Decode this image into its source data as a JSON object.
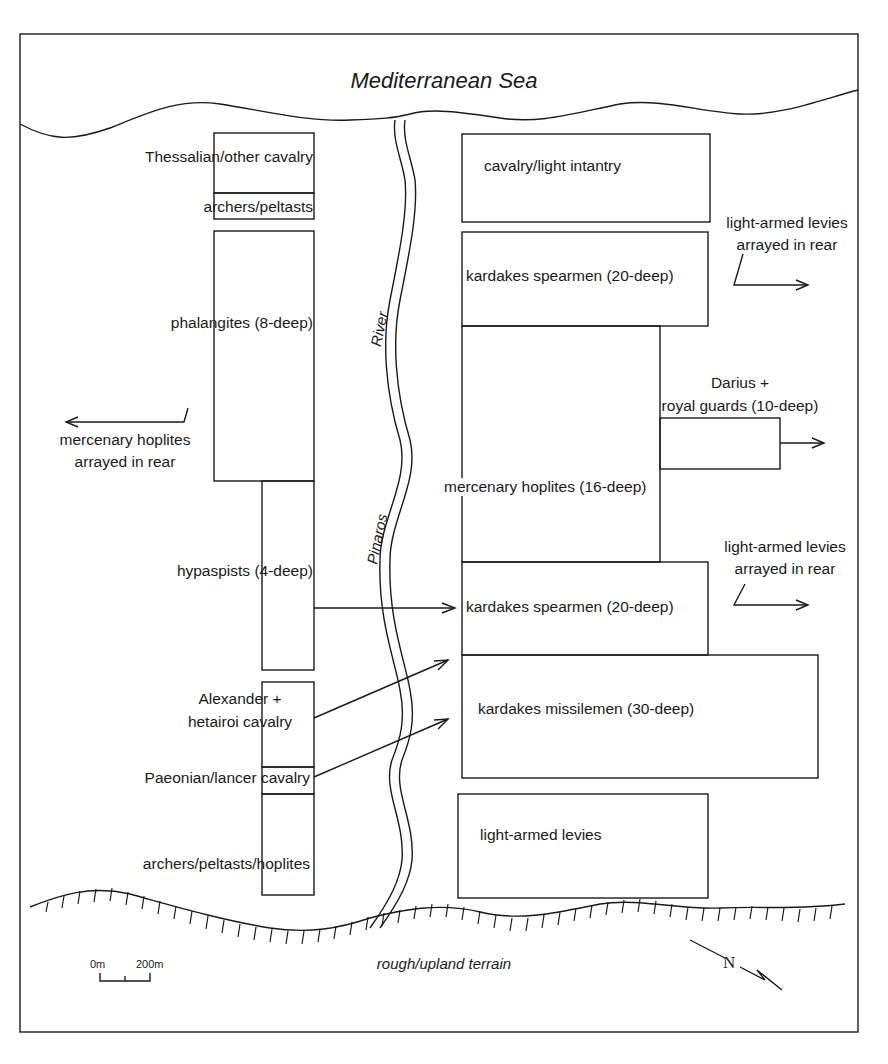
{
  "title": "Mediterranean Sea",
  "terrain_label": "rough/upland terrain",
  "river": {
    "word1": "River",
    "word2": "Pinaros"
  },
  "scale": {
    "start": "0m",
    "end": "200m"
  },
  "compass": {
    "label": "N"
  },
  "macedonian_units": [
    {
      "label": "Thessalian/other cavalry"
    },
    {
      "label": "archers/peltasts"
    },
    {
      "label": "phalangites (8-deep)"
    },
    {
      "label": "hypaspists (4-deep)"
    },
    {
      "label": "Alexander +",
      "label2": "hetairoi cavalry"
    },
    {
      "label": "Paeonian/lancer cavalry"
    },
    {
      "label": "archers/peltasts/hoplites"
    }
  ],
  "macedonian_rear_note": {
    "line1": "mercenary hoplites",
    "line2": "arrayed in rear"
  },
  "persian_units": [
    {
      "label": "cavalry/light intantry"
    },
    {
      "label": "kardakes spearmen (20-deep)"
    },
    {
      "label": "mercenary hoplites (16-deep)"
    },
    {
      "label": "Darius +",
      "label2": "royal guards (10-deep)"
    },
    {
      "label": "kardakes spearmen (20-deep)"
    },
    {
      "label": "kardakes missilemen (30-deep)"
    },
    {
      "label": "light-armed levies"
    }
  ],
  "persian_rear_notes": [
    {
      "line1": "light-armed levies",
      "line2": "arrayed in rear"
    },
    {
      "line1": "light-armed levies",
      "line2": "arrayed in rear"
    }
  ],
  "colors": {
    "ink": "#1a1a1a",
    "background": "#ffffff"
  }
}
